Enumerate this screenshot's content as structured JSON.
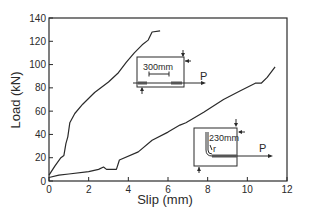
{
  "chart_data": {
    "type": "line",
    "title": "",
    "xlabel": "Slip (mm)",
    "ylabel": "Load (kN)",
    "xlim": [
      0,
      12
    ],
    "ylim": [
      0,
      140
    ],
    "xticks": [
      0,
      2,
      4,
      6,
      8,
      10,
      12
    ],
    "yticks": [
      0,
      20,
      40,
      60,
      80,
      100,
      120,
      140
    ],
    "grid": false,
    "legend": null,
    "series": [
      {
        "name": "Straight bar (300 mm embedment)",
        "x": [
          0,
          0.3,
          0.6,
          0.75,
          0.85,
          0.95,
          1.05,
          1.3,
          1.7,
          2.3,
          3.0,
          3.5,
          3.9,
          4.3,
          4.7,
          5.0,
          5.2,
          5.6
        ],
        "y": [
          5,
          13,
          20,
          22,
          32,
          38,
          50,
          58,
          66,
          76,
          85,
          93,
          102,
          110,
          117,
          121,
          128,
          129
        ]
      },
      {
        "name": "Hooked bar (230 mm)",
        "x": [
          0,
          0.5,
          1.0,
          2.0,
          2.5,
          2.75,
          2.9,
          3.4,
          3.55,
          4.5,
          5.2,
          6.0,
          6.6,
          6.9,
          7.8,
          8.8,
          9.6,
          10.4,
          10.7,
          11.0,
          11.4
        ],
        "y": [
          3,
          5,
          6,
          8,
          10,
          12,
          10,
          10,
          18,
          25,
          35,
          42,
          48,
          50,
          59,
          70,
          77,
          84,
          84,
          89,
          98
        ]
      }
    ],
    "annotations": [
      {
        "text": "300mm",
        "type": "inset-diagram",
        "near_series": 0,
        "force_label": "P"
      },
      {
        "text": "230mm",
        "type": "inset-diagram",
        "near_series": 1,
        "force_label": "P",
        "radius_label": "r"
      }
    ]
  },
  "axes": {
    "x_title": "Slip (mm)",
    "y_title": "Load (kN)",
    "x_ticks": [
      "0",
      "2",
      "4",
      "6",
      "8",
      "10",
      "12"
    ],
    "y_ticks": [
      "0",
      "20",
      "40",
      "60",
      "80",
      "100",
      "120",
      "140"
    ]
  },
  "insets": {
    "straight": {
      "dimension": "300mm",
      "force": "P"
    },
    "hooked": {
      "dimension": "230mm",
      "force": "P",
      "radius": "r"
    }
  },
  "colors": {
    "line": "#2a2a2a",
    "bar_fill": "#555555"
  }
}
